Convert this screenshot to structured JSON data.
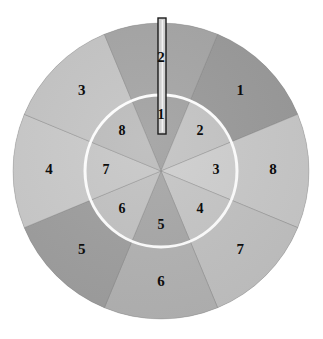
{
  "figure": {
    "type": "diagram",
    "background_color": "#ffffff"
  },
  "disc": {
    "center": {
      "x": 161,
      "y": 171
    },
    "outer_radius": 148,
    "inner_radius": 76,
    "ring_divider": {
      "color": "#ffffff",
      "stroke_width": 3,
      "radius": 76,
      "name": "white-boundary-circle"
    },
    "outer_ring": {
      "sector_count": 8,
      "start_angle_deg": -67.5,
      "sweep_deg": 45,
      "sectors": [
        {
          "label": "1",
          "color": "#9a9a9a",
          "label_angle_deg": -45,
          "label_radius": 112
        },
        {
          "label": "8",
          "color": "#c9c9c9",
          "label_angle_deg": 0,
          "label_radius": 112
        },
        {
          "label": "7",
          "color": "#c2c2c2",
          "label_angle_deg": 45,
          "label_radius": 112
        },
        {
          "label": "6",
          "color": "#b3b3b3",
          "label_angle_deg": 90,
          "label_radius": 112
        },
        {
          "label": "5",
          "color": "#9f9f9f",
          "label_angle_deg": 135,
          "label_radius": 112
        },
        {
          "label": "4",
          "color": "#cbcbcb",
          "label_angle_deg": 180,
          "label_radius": 112
        },
        {
          "label": "3",
          "color": "#c6c6c6",
          "label_angle_deg": 225,
          "label_radius": 112
        },
        {
          "label": "2",
          "color": "#a6a6a6",
          "label_angle_deg": 270,
          "label_radius": 112
        }
      ]
    },
    "inner_ring": {
      "sector_count": 8,
      "start_angle_deg": -112.5,
      "sweep_deg": 45,
      "sectors": [
        {
          "label": "1",
          "color": "#a3a3a3",
          "label_angle_deg": -90,
          "label_radius": 55
        },
        {
          "label": "2",
          "color": "#c4c4c4",
          "label_angle_deg": -45,
          "label_radius": 55
        },
        {
          "label": "3",
          "color": "#cfcfcf",
          "label_angle_deg": 0,
          "label_radius": 55
        },
        {
          "label": "4",
          "color": "#c6c6c6",
          "label_angle_deg": 45,
          "label_radius": 55
        },
        {
          "label": "5",
          "color": "#a8a8a8",
          "label_angle_deg": 90,
          "label_radius": 55
        },
        {
          "label": "6",
          "color": "#c2c2c2",
          "label_angle_deg": 135,
          "label_radius": 55
        },
        {
          "label": "7",
          "color": "#c8c8c8",
          "label_angle_deg": 180,
          "label_radius": 55
        },
        {
          "label": "8",
          "color": "#bdbdbd",
          "label_angle_deg": 225,
          "label_radius": 55
        }
      ]
    },
    "edge_color": "#bdbdbd"
  },
  "pointer": {
    "name": "pointer-rod",
    "x": 158,
    "y_top": 18,
    "y_bottom": 134,
    "width": 8,
    "edge_color": "#1c1c1c",
    "fill_color": "#cfcfcf",
    "highlight_color": "#f2f2f2"
  }
}
